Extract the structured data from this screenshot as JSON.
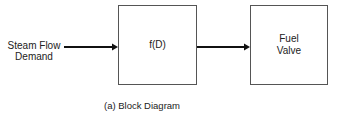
{
  "input": {
    "line1": "Steam Flow",
    "line2": "Demand"
  },
  "blocks": [
    {
      "id": "function-block",
      "label_line1": "f(D)",
      "label_line2": ""
    },
    {
      "id": "fuel-valve-block",
      "label_line1": "Fuel",
      "label_line2": "Valve"
    }
  ],
  "caption": "(a) Block Diagram",
  "colors": {
    "stroke": "#555555",
    "arrow": "#111111",
    "text": "#222222"
  }
}
